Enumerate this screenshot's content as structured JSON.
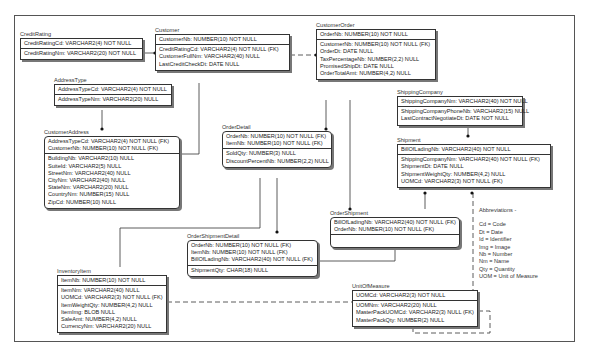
{
  "diagram": {
    "type": "entity-relationship",
    "entities": [
      {
        "id": "credit-rating",
        "name": "CreditRating",
        "pk": [
          "CreditRatingCd: VARCHAR2(4) NOT NULL"
        ],
        "attrs": [
          "CreditRatingNm: VARCHAR2(20) NOT NULL"
        ]
      },
      {
        "id": "customer",
        "name": "Customer",
        "pk": [
          "CustomerNb: NUMBER(10) NOT NULL"
        ],
        "attrs": [
          "CreditRatingCd: VARCHAR2(4) NOT NULL (FK)",
          "CustomerFullNm: VARCHAR2(40) NULL",
          "LastCreditCheckDt: DATE NULL"
        ]
      },
      {
        "id": "customer-order",
        "name": "CustomerOrder",
        "pk": [
          "OrderNb: NUMBER(10) NOT NULL"
        ],
        "attrs": [
          "CustomerNb: NUMBER(10) NOT NULL (FK)",
          "OrderDt: DATE NULL",
          "TaxPercentageNb: NUMBER(2,2) NULL",
          "PromisedShipDt: DATE NULL",
          "OrderTotalAmt: NUMBER(4,2) NULL"
        ]
      },
      {
        "id": "address-type",
        "name": "AddressType",
        "pk": [
          "AddressTypeCd: VARCHAR2(4) NOT NULL"
        ],
        "attrs": [
          "AddressTypeNm: VARCHAR2(20) NULL"
        ]
      },
      {
        "id": "customer-address",
        "name": "CustomerAddress",
        "pk": [
          "AddressTypeCd: VARCHAR2(4) NOT NULL (FK)",
          "CustomerNb: NUMBER(10) NOT NULL (FK)"
        ],
        "attrs": [
          "BuildingNb: VARCHAR2(10) NULL",
          "SuiteId: VARCHAR2(5) NULL",
          "StreetNm: VARCHAR2(40) NULL",
          "CityNm: VARCHAR2(40) NULL",
          "StateNm: VARCHAR2(20) NULL",
          "CountryNm: NUMBER(15) NULL",
          "ZipCd: NUMBER(10) NULL"
        ]
      },
      {
        "id": "order-detail",
        "name": "OrderDetail",
        "pk": [
          "OrderNb: NUMBER(10) NOT NULL (FK)",
          "ItemNb: NUMBER(10) NOT NULL (FK)"
        ],
        "attrs": [
          "SoldQty: NUMBER(3) NULL",
          "DiscountPercentNb: NUMBER(2,2) NULL"
        ]
      },
      {
        "id": "shipping-company",
        "name": "ShippingCompany",
        "pk": [
          "ShippingCompanyNm: VARCHAR2(40) NOT NULL"
        ],
        "attrs": [
          "ShippingCompanyPhoneNb: VARCHAR2(15) NULL",
          "LastContractNegotiateDt: DATE NOT NULL"
        ]
      },
      {
        "id": "shipment",
        "name": "Shipment",
        "pk": [
          "BillOfLadingNb: VARCHAR2(40) NOT NULL"
        ],
        "attrs": [
          "ShippingCompanyNm: VARCHAR2(40) NOT NULL (FK)",
          "ShipmentDt: DATE NULL",
          "ShipmentWeightQty: NUMBER(4,2) NULL",
          "UOMCd: VARCHAR2(3) NOT NULL (FK)"
        ]
      },
      {
        "id": "order-shipment",
        "name": "OrderShipment",
        "pk": [
          "BillOfLadingNb: VARCHAR2(40) NOT NULL (FK)",
          "OrderNb: NUMBER(10) NOT NULL (FK)"
        ],
        "attrs": []
      },
      {
        "id": "order-shipment-detail",
        "name": "OrderShipmentDetail",
        "pk": [
          "OrderNb: NUMBER(10) NOT NULL (FK)",
          "ItemNb: NUMBER(10) NOT NULL (FK)",
          "BillOfLadingNb: VARCHAR2(40) NOT NULL (FK)"
        ],
        "attrs": [
          "ShipmentQty: CHAR(18) NULL"
        ]
      },
      {
        "id": "inventory-item",
        "name": "InventoryItem",
        "pk": [
          "ItemNb: NUMBER(10) NOT NULL"
        ],
        "attrs": [
          "ItemNm: VARCHAR2(40) NULL",
          "UOMCd: VARCHAR2(3) NOT NULL (FK)",
          "ItemWeightQty: NUMBER(4,2) NULL",
          "ItemImg: BLOB NULL",
          "SaleAmt: NUMBER(4,2) NULL",
          "CurrencyNm: VARCHAR2(20) NULL"
        ]
      },
      {
        "id": "unit-of-measure",
        "name": "UnitOfMeasure",
        "pk": [
          "UOMCd: VARCHAR2(3) NOT NULL"
        ],
        "attrs": [
          "UOMNm: VARCHAR2(20) NULL",
          "MasterPackUOMCd: VARCHAR2(3) NULL (FK)",
          "MasterPackQty: NUMBER(2) NULL"
        ]
      }
    ],
    "relationships": [
      {
        "from": "CreditRating",
        "to": "Customer",
        "style": "solid"
      },
      {
        "from": "Customer",
        "to": "CustomerOrder",
        "style": "dashed"
      },
      {
        "from": "Customer",
        "to": "CustomerAddress",
        "style": "solid"
      },
      {
        "from": "AddressType",
        "to": "CustomerAddress",
        "style": "solid"
      },
      {
        "from": "CustomerOrder",
        "to": "OrderDetail",
        "style": "solid"
      },
      {
        "from": "CustomerOrder",
        "to": "OrderShipment",
        "style": "solid"
      },
      {
        "from": "ShippingCompany",
        "to": "Shipment",
        "style": "solid"
      },
      {
        "from": "Shipment",
        "to": "OrderShipment",
        "style": "solid"
      },
      {
        "from": "OrderDetail",
        "to": "OrderShipmentDetail",
        "style": "solid"
      },
      {
        "from": "OrderDetail",
        "to": "InventoryItem",
        "style": "solid"
      },
      {
        "from": "OrderShipment",
        "to": "OrderShipmentDetail",
        "style": "solid"
      },
      {
        "from": "UnitOfMeasure",
        "to": "InventoryItem",
        "style": "dashed"
      },
      {
        "from": "UnitOfMeasure",
        "to": "Shipment",
        "style": "dashed"
      },
      {
        "from": "UnitOfMeasure",
        "to": "UnitOfMeasure",
        "style": "dashed"
      }
    ]
  },
  "abbreviations": {
    "title": "Abbreviations -",
    "items": [
      "Cd = Code",
      "Dt = Date",
      "Id = Identifier",
      "Img = Image",
      "Nb = Number",
      "Nm = Name",
      "Qty = Quantity",
      "UOM = Unit of Measure"
    ]
  }
}
